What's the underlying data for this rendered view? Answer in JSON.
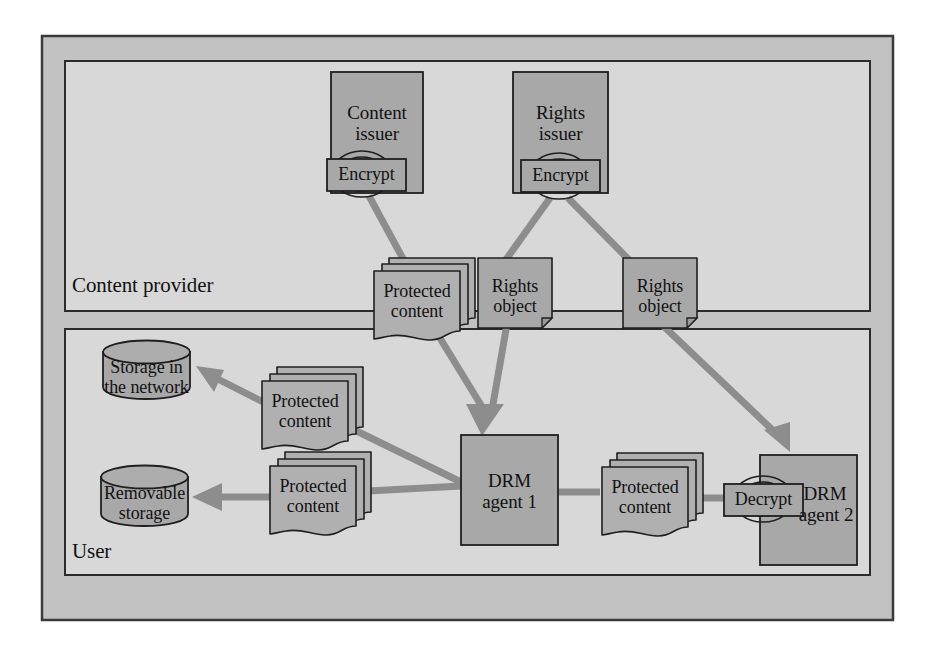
{
  "diagram": {
    "colors": {
      "page_background": "#ffffff",
      "outer_frame_fill": "#c2c2c2",
      "outer_frame_stroke": "#3a3a3a",
      "zone_fill": "#d6d6d6",
      "zone_stroke": "#2b2b2b",
      "node_fill": "#a8a8a8",
      "node_stroke": "#1f1f1f",
      "doc_fill": "#b0b0b0",
      "arrow_fill": "#8d8d8d",
      "text": "#111111"
    },
    "zones": [
      {
        "id": "content-provider",
        "label": "Content provider"
      },
      {
        "id": "user",
        "label": "User"
      }
    ],
    "nodes": {
      "content_issuer": {
        "label_line1": "Content",
        "label_line2": "issuer"
      },
      "rights_issuer": {
        "label_line1": "Rights",
        "label_line2": "issuer"
      },
      "encrypt_content": {
        "label": "Encrypt"
      },
      "encrypt_rights": {
        "label": "Encrypt"
      },
      "protected_content_provider": {
        "label_line1": "Protected",
        "label_line2": "content"
      },
      "rights_object_1": {
        "label_line1": "Rights",
        "label_line2": "object"
      },
      "rights_object_2": {
        "label_line1": "Rights",
        "label_line2": "object"
      },
      "storage_network": {
        "label_line1": "Storage in",
        "label_line2": "the network"
      },
      "removable_storage": {
        "label_line1": "Removable",
        "label_line2": "storage"
      },
      "protected_content_network": {
        "label_line1": "Protected",
        "label_line2": "content"
      },
      "protected_content_removable": {
        "label_line1": "Protected",
        "label_line2": "content"
      },
      "protected_content_agent": {
        "label_line1": "Protected",
        "label_line2": "content"
      },
      "drm_agent_1": {
        "label_line1": "DRM",
        "label_line2": "agent 1"
      },
      "drm_agent_2": {
        "label_line1": "DRM",
        "label_line2": "agent 2"
      },
      "decrypt": {
        "label": "Decrypt"
      }
    },
    "edges": [
      {
        "from": "encrypt_content",
        "to": "protected_content_provider",
        "arrow": false
      },
      {
        "from": "encrypt_rights",
        "to": "rights_object_1",
        "arrow": false
      },
      {
        "from": "encrypt_rights",
        "to": "rights_object_2",
        "arrow": false
      },
      {
        "from": "protected_content_provider",
        "to": "drm_agent_1",
        "arrow": true
      },
      {
        "from": "rights_object_1",
        "to": "drm_agent_1",
        "arrow": true
      },
      {
        "from": "rights_object_2",
        "to": "drm_agent_2",
        "arrow": true
      },
      {
        "from": "drm_agent_1",
        "to": "protected_content_network",
        "arrow": false
      },
      {
        "from": "protected_content_network",
        "to": "storage_network",
        "arrow": true
      },
      {
        "from": "drm_agent_1",
        "to": "protected_content_removable",
        "arrow": false
      },
      {
        "from": "protected_content_removable",
        "to": "removable_storage",
        "arrow": true
      },
      {
        "from": "drm_agent_1",
        "to": "protected_content_agent",
        "arrow": false
      },
      {
        "from": "protected_content_agent",
        "to": "decrypt",
        "arrow": false
      }
    ]
  }
}
